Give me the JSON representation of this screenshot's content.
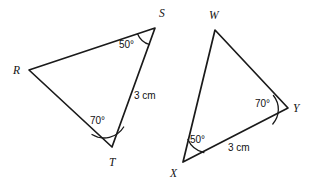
{
  "figure": {
    "background_color": "#ffffff",
    "stroke_color": "#1a1a1a",
    "text_color": "#111111"
  },
  "triangles": [
    {
      "id": "triangle-rst",
      "name": "RST",
      "vertices": [
        {
          "key": "R",
          "label": "R",
          "x": 29,
          "y": 70,
          "label_x": 13,
          "label_y": 74
        },
        {
          "key": "S",
          "label": "S",
          "x": 155,
          "y": 28,
          "label_x": 159,
          "label_y": 17
        },
        {
          "key": "T",
          "label": "T",
          "x": 112,
          "y": 147,
          "label_x": 109,
          "label_y": 166
        }
      ],
      "angles": [
        {
          "at": "S",
          "value": "50°",
          "label_x": 119,
          "label_y": 48
        },
        {
          "at": "T",
          "value": "70°",
          "label_x": 90,
          "label_y": 124
        }
      ],
      "sides": [
        {
          "from": "S",
          "to": "T",
          "length": "3 cm",
          "label_x": 134,
          "label_y": 99
        }
      ]
    },
    {
      "id": "triangle-wxy",
      "name": "WXY",
      "vertices": [
        {
          "key": "W",
          "label": "W",
          "x": 215,
          "y": 30,
          "label_x": 209,
          "label_y": 19
        },
        {
          "key": "X",
          "label": "X",
          "x": 183,
          "y": 162,
          "label_x": 170,
          "label_y": 177
        },
        {
          "key": "Y",
          "label": "Y",
          "x": 288,
          "y": 108,
          "label_x": 293,
          "label_y": 112
        }
      ],
      "angles": [
        {
          "at": "X",
          "value": "50°",
          "label_x": 190,
          "label_y": 143
        },
        {
          "at": "Y",
          "value": "70°",
          "label_x": 255,
          "label_y": 107
        }
      ],
      "sides": [
        {
          "from": "X",
          "to": "Y",
          "length": "3 cm",
          "label_x": 228,
          "label_y": 151
        }
      ]
    }
  ]
}
